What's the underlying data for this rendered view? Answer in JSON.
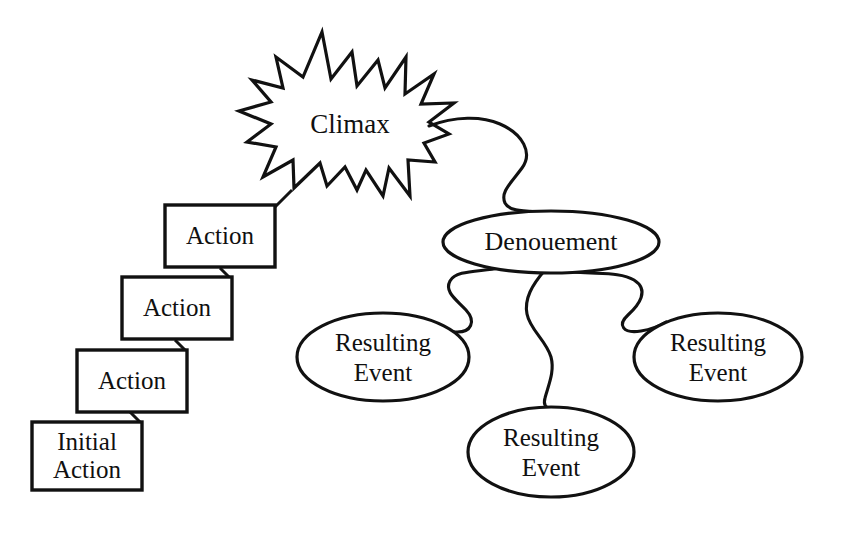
{
  "diagram": {
    "background_color": "#ffffff",
    "line_color": "#111111",
    "fill_color": "#ffffff",
    "rising_action": {
      "step_label": "Action",
      "initial_label_line1": "Initial",
      "initial_label_line2": "Action",
      "steps": [
        {
          "label": "Action",
          "x": 165,
          "y": 205,
          "w": 110,
          "h": 62
        },
        {
          "label": "Action",
          "x": 122,
          "y": 277,
          "w": 110,
          "h": 62
        },
        {
          "label": "Action",
          "x": 77,
          "y": 350,
          "w": 110,
          "h": 62
        },
        {
          "label": "Initial Action",
          "x": 32,
          "y": 422,
          "w": 110,
          "h": 68
        }
      ]
    },
    "climax": {
      "label": "Climax",
      "shape": "starburst",
      "center_x": 350,
      "center_y": 125
    },
    "denouement": {
      "label": "Denouement",
      "shape": "ellipse",
      "center_x": 551,
      "center_y": 242,
      "rx": 108,
      "ry": 31
    },
    "resulting_events": [
      {
        "label_line1": "Resulting",
        "label_line2": "Event",
        "shape": "ellipse",
        "center_x": 383,
        "center_y": 357,
        "rx": 86,
        "ry": 44,
        "position": "left"
      },
      {
        "label_line1": "Resulting",
        "label_line2": "Event",
        "shape": "ellipse",
        "center_x": 551,
        "center_y": 452,
        "rx": 83,
        "ry": 45,
        "position": "bottom"
      },
      {
        "label_line1": "Resulting",
        "label_line2": "Event",
        "shape": "ellipse",
        "center_x": 718,
        "center_y": 357,
        "rx": 84,
        "ry": 44,
        "position": "right"
      }
    ],
    "connector_style": "wavy-freehand"
  }
}
